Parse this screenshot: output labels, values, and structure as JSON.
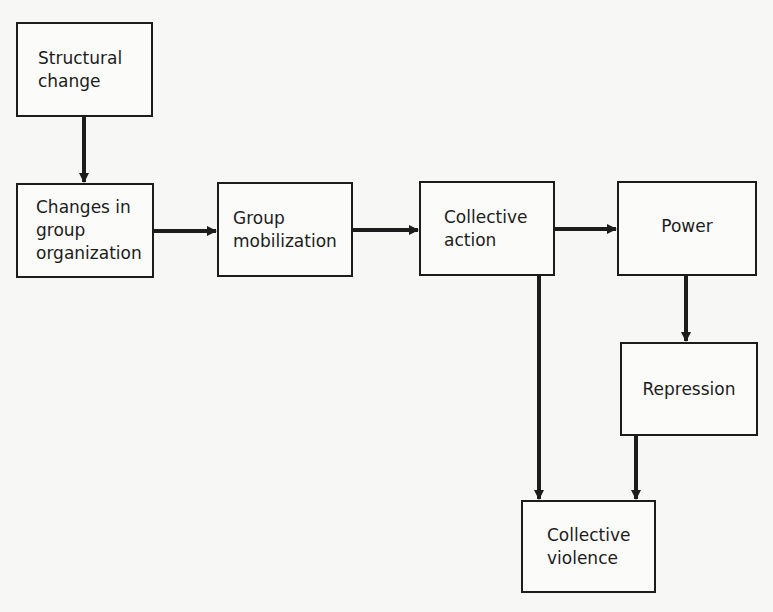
{
  "diagram": {
    "nodes": [
      {
        "id": "structural-change",
        "label": "Structural\nchange"
      },
      {
        "id": "changes-in-group-organization",
        "label": "Changes in\ngroup\norganization"
      },
      {
        "id": "group-mobilization",
        "label": "Group\nmobilization"
      },
      {
        "id": "collective-action",
        "label": "Collective\naction"
      },
      {
        "id": "power",
        "label": "Power"
      },
      {
        "id": "repression",
        "label": "Repression"
      },
      {
        "id": "collective-violence",
        "label": "Collective\nviolence"
      }
    ],
    "edges": [
      {
        "from": "structural-change",
        "to": "changes-in-group-organization"
      },
      {
        "from": "changes-in-group-organization",
        "to": "group-mobilization"
      },
      {
        "from": "group-mobilization",
        "to": "collective-action"
      },
      {
        "from": "collective-action",
        "to": "power"
      },
      {
        "from": "collective-action",
        "to": "collective-violence"
      },
      {
        "from": "power",
        "to": "repression"
      },
      {
        "from": "repression",
        "to": "collective-violence"
      }
    ],
    "colors": {
      "line": "#1c1c1c",
      "background": "#f7f7f5"
    }
  }
}
